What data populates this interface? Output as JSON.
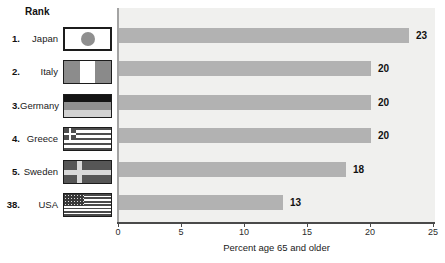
{
  "header": {
    "rank_label": "Rank"
  },
  "rows": [
    {
      "rank": "1.",
      "country": "Japan",
      "value": 23,
      "flag_icon": "japan-flag-icon"
    },
    {
      "rank": "2.",
      "country": "Italy",
      "value": 20,
      "flag_icon": "italy-flag-icon"
    },
    {
      "rank": "3.",
      "country": "Germany",
      "value": 20,
      "flag_icon": "germany-flag-icon"
    },
    {
      "rank": "4.",
      "country": "Greece",
      "value": 20,
      "flag_icon": "greece-flag-icon"
    },
    {
      "rank": "5.",
      "country": "Sweden",
      "value": 18,
      "flag_icon": "sweden-flag-icon"
    },
    {
      "rank": "38.",
      "country": "USA",
      "value": 13,
      "flag_icon": "usa-flag-icon"
    }
  ],
  "chart_data": {
    "type": "bar",
    "orientation": "horizontal",
    "categories": [
      "Japan",
      "Italy",
      "Germany",
      "Greece",
      "Sweden",
      "USA"
    ],
    "category_ranks": [
      "1.",
      "2.",
      "3.",
      "4.",
      "5.",
      "38."
    ],
    "values": [
      23,
      20,
      20,
      20,
      18,
      13
    ],
    "value_labels": [
      "23",
      "20",
      "20",
      "20",
      "18",
      "13"
    ],
    "title": "",
    "xlabel": "Percent age 65 and older",
    "ylabel": "Rank",
    "xlim": [
      0,
      25
    ],
    "xticks": [
      0,
      5,
      10,
      15,
      20,
      25
    ],
    "xtick_labels": [
      "0",
      "5",
      "10",
      "15",
      "20",
      "25"
    ],
    "grid": false,
    "legend": null,
    "bar_color": "#b2b2b2",
    "plot_bg_color": "#f0f0ee",
    "axis_line_color": "#4a4a4a"
  }
}
